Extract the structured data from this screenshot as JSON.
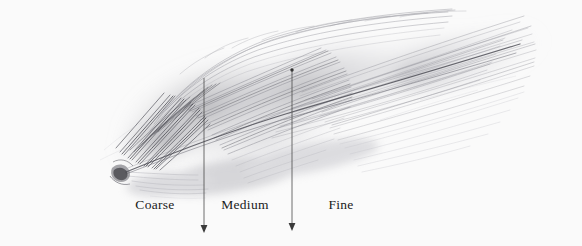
{
  "figure": {
    "medium": "graphite pencil drawing",
    "background_color": "#fafafa",
    "ink_color": "#1a1a1a",
    "width": 582,
    "height": 246
  },
  "zones": [
    {
      "label": "Coarse",
      "center_x": 155,
      "label_y": 204
    },
    {
      "label": "Medium",
      "center_x": 245,
      "label_y": 204
    },
    {
      "label": "Fine",
      "center_x": 341,
      "label_y": 204
    }
  ],
  "dividers": [
    {
      "name": "coarse-medium-divider",
      "x": 204,
      "y_top": 78,
      "y_bottom": 232
    },
    {
      "name": "medium-fine-divider",
      "x": 292,
      "y_top": 69,
      "y_bottom": 230
    }
  ],
  "drawing": {
    "quill_base": {
      "x": 118,
      "y": 170
    },
    "tip_direction": "upper-right",
    "shaft_color": "#3a3a3a",
    "barb_color": "#8d8d93"
  }
}
